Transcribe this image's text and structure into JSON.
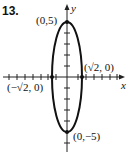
{
  "problem_number": "13.",
  "axes": {
    "x_label": "x",
    "y_label": "y"
  },
  "curve": {
    "type": "ellipse",
    "center": [
      0,
      0
    ],
    "semi_x": "√2",
    "semi_y": 5
  },
  "points": [
    {
      "label": "(0,5)",
      "coords": [
        0,
        5
      ]
    },
    {
      "label": "(√2, 0)",
      "coords": [
        "√2",
        0
      ]
    },
    {
      "label": "(−√2, 0)",
      "coords": [
        "-√2",
        0
      ]
    },
    {
      "label": "(0,−5)",
      "coords": [
        0,
        -5
      ]
    }
  ],
  "colors": {
    "stroke": "#111111",
    "background": "#ffffff"
  }
}
